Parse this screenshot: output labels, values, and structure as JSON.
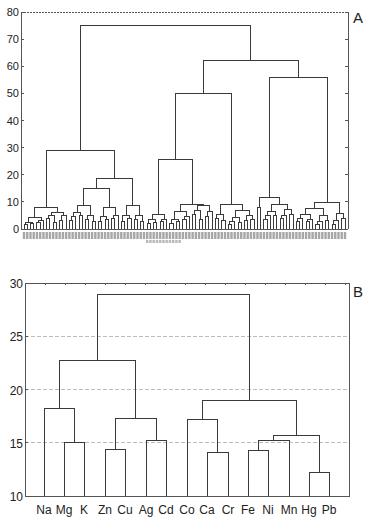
{
  "chart_data": [
    {
      "panel": "A",
      "type": "dendrogram",
      "title": "",
      "xlabel": "",
      "ylabel": "",
      "ylim": [
        0,
        80
      ],
      "yticks": [
        0,
        10,
        20,
        30,
        40,
        50,
        60,
        70,
        80
      ],
      "grid": false,
      "leaf_labels": "dense sample codes (illegible at this resolution)",
      "leaf_count_approx": 100,
      "major_merges": [
        {
          "height": 75,
          "joins": [
            "cluster-1",
            "cluster-2+3"
          ],
          "x": [
            63,
            238
          ]
        },
        {
          "height": 62,
          "joins": [
            "cluster-2",
            "cluster-3"
          ],
          "x": [
            181,
            295
          ]
        },
        {
          "height": 56,
          "joins": [
            "cluster-3a",
            "cluster-3b"
          ],
          "x": [
            260,
            330
          ]
        },
        {
          "height": 50,
          "joins": [
            "cluster-2a",
            "cluster-2b"
          ],
          "x": [
            144,
            218
          ]
        },
        {
          "height": 29,
          "joins": [
            "cluster-1a",
            "cluster-1b"
          ],
          "x": [
            36,
            89
          ]
        },
        {
          "height": 25.5,
          "joins": [
            "cluster-2a-i",
            "cluster-2a-ii"
          ],
          "x": [
            129,
            159
          ]
        },
        {
          "height": 18.5,
          "joins": [
            "cluster-1b-i",
            "cluster-1b-ii"
          ],
          "x": [
            74,
            105
          ]
        },
        {
          "height": 15,
          "joins": [
            "cluster-1b-i-a",
            "cluster-1b-i-b"
          ],
          "x": [
            63,
            86
          ]
        },
        {
          "height": 11.5,
          "joins": [
            "cluster-3a-i",
            "cluster-3a-ii"
          ],
          "x": [
            255,
            268
          ]
        },
        {
          "height": 9.5,
          "joins": [
            "cluster-3b-i",
            "cluster-3b-ii"
          ],
          "x": [
            312,
            340
          ]
        },
        {
          "height": 9,
          "joins": [
            "cluster-2b-i",
            "cluster-2b-ii"
          ],
          "x": [
            206,
            232
          ]
        },
        {
          "height": 9,
          "joins": [
            "cluster-2a-ii-a",
            "cluster-2a-ii-b"
          ],
          "x": [
            146,
            172
          ]
        }
      ]
    },
    {
      "panel": "B",
      "type": "dendrogram",
      "title": "",
      "xlabel": "",
      "ylabel": "",
      "ylim": [
        10,
        30
      ],
      "yticks": [
        10,
        15,
        20,
        25,
        30
      ],
      "grid": true,
      "categories": [
        "Na",
        "Mg",
        "K",
        "Zn",
        "Cu",
        "Ag",
        "Cd",
        "Co",
        "Ca",
        "Cr",
        "Fe",
        "Ni",
        "Mn",
        "Hg",
        "Pb"
      ],
      "merges": [
        {
          "left": "Mg",
          "right": "K",
          "height": 15.0
        },
        {
          "left": "Na",
          "right": "Mg+K",
          "height": 18.2
        },
        {
          "left": "Zn",
          "right": "Cu",
          "height": 14.4
        },
        {
          "left": "Ag",
          "right": "Cd",
          "height": 15.2
        },
        {
          "left": "Zn+Cu",
          "right": "Ag+Cd",
          "height": 17.3
        },
        {
          "left": "Na+Mg+K",
          "right": "Zn+Cu+Ag+Cd",
          "height": 22.7
        },
        {
          "left": "Ca",
          "right": "Cr",
          "height": 14.1
        },
        {
          "left": "Co",
          "right": "Ca+Cr",
          "height": 17.2
        },
        {
          "left": "Fe",
          "right": "Ni",
          "height": 14.3
        },
        {
          "left": "Fe+Ni",
          "right": "Mn",
          "height": 15.2
        },
        {
          "left": "Hg",
          "right": "Pb",
          "height": 12.2
        },
        {
          "left": "Fe+Ni+Mn",
          "right": "Hg+Pb",
          "height": 15.7
        },
        {
          "left": "Co+Ca+Cr",
          "right": "Fe+Ni+Mn+Hg+Pb",
          "height": 19.0
        },
        {
          "left": "Na…Cd",
          "right": "Co…Pb",
          "height": 28.9
        }
      ]
    }
  ],
  "panels": {
    "a": {
      "label": "A",
      "yticks": [
        "0",
        "10",
        "20",
        "30",
        "40",
        "50",
        "60",
        "70",
        "80"
      ]
    },
    "b": {
      "label": "B",
      "yticks": [
        "10",
        "15",
        "20",
        "25",
        "30"
      ],
      "leaves": [
        "Na",
        "Mg",
        "K",
        "Zn",
        "Cu",
        "Ag",
        "Cd",
        "Co",
        "Ca",
        "Cr",
        "Fe",
        "Ni",
        "Mn",
        "Hg",
        "Pb"
      ]
    }
  },
  "colors": {
    "line": "#3a3a3a",
    "grid": "#bdbdbd",
    "frame": "#555555",
    "text": "#222222"
  }
}
